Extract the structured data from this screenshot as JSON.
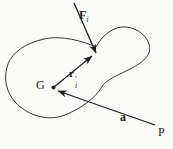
{
  "figure": {
    "colors": {
      "background": "#fbfbf9",
      "line": "#1f1f1f"
    },
    "labels": {
      "force": {
        "symbol": "F",
        "subscript": "i"
      },
      "position": {
        "symbol": "r",
        "prime": "′",
        "subscript": "i"
      },
      "centroid": "G",
      "vector_a": "a",
      "point_p": "P"
    }
  }
}
